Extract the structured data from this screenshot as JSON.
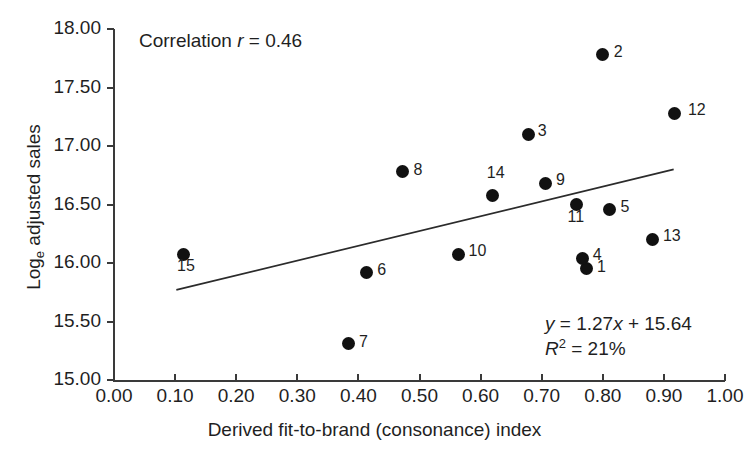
{
  "chart_data": {
    "type": "scatter",
    "title": "",
    "xlabel": "Derived fit-to-brand (consonance) index",
    "ylabel": "Log_e adjusted sales",
    "ylabel_prefix": "Log",
    "ylabel_sub": "e",
    "ylabel_suffix": " adjusted sales",
    "xlim": [
      0.0,
      1.0
    ],
    "ylim": [
      15.0,
      18.0
    ],
    "xticks": [
      "0.00",
      "0.10",
      "0.20",
      "0.30",
      "0.40",
      "0.50",
      "0.60",
      "0.70",
      "0.80",
      "0.90",
      "1.00"
    ],
    "yticks": [
      "15.00",
      "15.50",
      "16.00",
      "16.50",
      "17.00",
      "17.50",
      "18.00"
    ],
    "grid": false,
    "legend": "none",
    "marker_color": "#111111",
    "axis_color": "#3a3a3a",
    "points": [
      {
        "label": "1",
        "x": 0.774,
        "y": 15.95,
        "label_dx": 10,
        "label_dy": -3
      },
      {
        "label": "2",
        "x": 0.8,
        "y": 17.78,
        "label_dx": 11,
        "label_dy": -4
      },
      {
        "label": "3",
        "x": 0.679,
        "y": 17.1,
        "label_dx": 9,
        "label_dy": -4
      },
      {
        "label": "4",
        "x": 0.767,
        "y": 16.04,
        "label_dx": 10,
        "label_dy": -4
      },
      {
        "label": "5",
        "x": 0.811,
        "y": 16.46,
        "label_dx": 11,
        "label_dy": -3
      },
      {
        "label": "6",
        "x": 0.413,
        "y": 15.92,
        "label_dx": 11,
        "label_dy": -3
      },
      {
        "label": "7",
        "x": 0.383,
        "y": 15.31,
        "label_dx": 11,
        "label_dy": -3
      },
      {
        "label": "8",
        "x": 0.472,
        "y": 16.78,
        "label_dx": 11,
        "label_dy": -3
      },
      {
        "label": "9",
        "x": 0.707,
        "y": 16.68,
        "label_dx": 10,
        "label_dy": -4
      },
      {
        "label": "10",
        "x": 0.564,
        "y": 16.07,
        "label_dx": 10,
        "label_dy": -5
      },
      {
        "label": "11",
        "x": 0.757,
        "y": 16.5,
        "label_dx": -9,
        "label_dy": 11
      },
      {
        "label": "12",
        "x": 0.918,
        "y": 17.28,
        "label_dx": 13,
        "label_dy": -4
      },
      {
        "label": "13",
        "x": 0.882,
        "y": 16.2,
        "label_dx": 10,
        "label_dy": -5
      },
      {
        "label": "14",
        "x": 0.62,
        "y": 16.58,
        "label_dx": -6,
        "label_dy": -23
      },
      {
        "label": "15",
        "x": 0.113,
        "y": 16.07,
        "label_dx": -6,
        "label_dy": 10
      }
    ],
    "fit_line": {
      "slope": 1.27,
      "intercept": 15.64,
      "x_start": 0.102,
      "x_end": 0.916,
      "y_start": 15.77,
      "y_end": 16.8
    },
    "annotations": {
      "correlation": {
        "prefix": "Correlation ",
        "symbol": "r",
        "suffix": " = 0.46",
        "full": "Correlation r = 0.46",
        "value": 0.46
      },
      "equation": {
        "y_var": "y",
        "line1_rest": " = 1.27",
        "x_var": "x",
        "line1_tail": " + 15.64",
        "line1_full": "y = 1.27x + 15.64",
        "r2_symbol": "R",
        "r2_sup": "2",
        "r2_rest": " = 21%",
        "line2_full": "R2 = 21%",
        "r2_value": "21%"
      }
    }
  }
}
